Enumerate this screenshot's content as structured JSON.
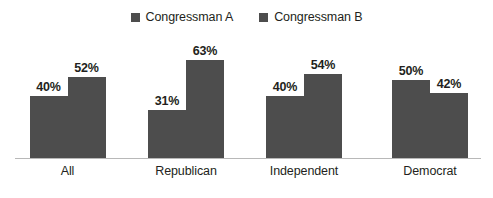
{
  "chart_data": {
    "type": "bar",
    "title": "",
    "subtitle": "",
    "xlabel": "",
    "ylabel": "",
    "ylim": [
      0,
      70
    ],
    "grid": false,
    "legend_position": "top-center",
    "value_suffix": "%",
    "categories": [
      "All",
      "Republican",
      "Independent",
      "Democrat"
    ],
    "series": [
      {
        "name": "Congressman A",
        "color": "#4d4d4d",
        "values": [
          40,
          31,
          40,
          50
        ],
        "labels": [
          "40%",
          "31%",
          "40%",
          "50%"
        ]
      },
      {
        "name": "Congressman B",
        "color": "#4d4d4d",
        "values": [
          52,
          63,
          54,
          42
        ],
        "labels": [
          "52%",
          "63%",
          "54%",
          "42%"
        ]
      }
    ]
  },
  "legend": {
    "items": [
      {
        "label": "Congressman A",
        "marker": "square-marker-icon",
        "color": "#4d4d4d"
      },
      {
        "label": "Congressman B",
        "marker": "square-marker-icon",
        "color": "#4d4d4d"
      }
    ]
  },
  "axis": {
    "categories": [
      "All",
      "Republican",
      "Independent",
      "Democrat"
    ],
    "baseline_color": "#b8b8b8"
  },
  "colors": {
    "bar_fill": "#4d4d4d",
    "text": "#231f20",
    "background": "#ffffff",
    "axis": "#b8b8b8"
  }
}
